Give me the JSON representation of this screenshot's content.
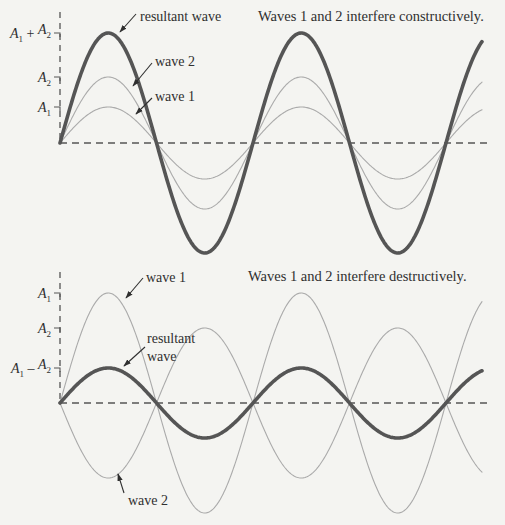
{
  "colors": {
    "background": "#f4f4f1",
    "resultant_stroke": "#555555",
    "component_stroke": "#aaaaaa",
    "axis_stroke": "#555555",
    "text": "#2f2f2f"
  },
  "chart_data": [
    {
      "type": "line",
      "title": "Waves 1 and 2 interfere constructively.",
      "origin_px": [
        60,
        143
      ],
      "x_end_px": 482,
      "axis_end_px": 487,
      "axis_top_px": 12,
      "period_px": 193,
      "series": [
        {
          "name": "wave 1",
          "amplitude_px": 36,
          "phase": 0,
          "role": "component"
        },
        {
          "name": "wave 2",
          "amplitude_px": 66,
          "phase": 0,
          "role": "component"
        },
        {
          "name": "resultant wave",
          "amplitude_px": 110,
          "phase": 0,
          "role": "resultant"
        }
      ],
      "y_ticks": [
        {
          "label_main": "A",
          "label_sub": "1",
          "label_op": "",
          "label_main2": "",
          "label_sub2": "",
          "value_px": 36
        },
        {
          "label_main": "A",
          "label_sub": "2",
          "label_op": "",
          "label_main2": "",
          "label_sub2": "",
          "value_px": 66
        },
        {
          "label_main": "A",
          "label_sub": "1",
          "label_op": "+",
          "label_main2": "A",
          "label_sub2": "2",
          "value_px": 110
        }
      ],
      "annotations": [
        {
          "text": "resultant wave",
          "text_pos": [
            140,
            21
          ],
          "arrow_from": [
            136,
            14
          ],
          "arrow_to": [
            120,
            32
          ]
        },
        {
          "text": "wave 2",
          "text_pos": [
            155,
            66
          ],
          "arrow_from": [
            152,
            63
          ],
          "arrow_to": [
            133,
            86
          ]
        },
        {
          "text": "wave 1",
          "text_pos": [
            155,
            101
          ],
          "arrow_from": [
            152,
            98
          ],
          "arrow_to": [
            136,
            114
          ]
        }
      ]
    },
    {
      "type": "line",
      "title": "Waves 1 and 2 interfere destructively.",
      "origin_px": [
        60,
        403
      ],
      "x_end_px": 482,
      "axis_end_px": 487,
      "axis_top_px": 272,
      "period_px": 193,
      "series": [
        {
          "name": "wave 1",
          "amplitude_px": 110,
          "phase": 0,
          "role": "component"
        },
        {
          "name": "wave 2",
          "amplitude_px": 75,
          "phase": 180,
          "role": "component"
        },
        {
          "name": "resultant wave",
          "amplitude_px": 35,
          "phase": 0,
          "role": "resultant"
        }
      ],
      "y_ticks": [
        {
          "label_main": "A",
          "label_sub": "1",
          "label_op": "",
          "label_main2": "",
          "label_sub2": "",
          "value_px": 110
        },
        {
          "label_main": "A",
          "label_sub": "2",
          "label_op": "",
          "label_main2": "",
          "label_sub2": "",
          "value_px": 75
        },
        {
          "label_main": "A",
          "label_sub": "1",
          "label_op": "–",
          "label_main2": "A",
          "label_sub2": "2",
          "value_px": 35
        }
      ],
      "annotations": [
        {
          "text": "wave 1",
          "text_pos": [
            146,
            282
          ],
          "arrow_from": [
            143,
            278
          ],
          "arrow_to": [
            126,
            298
          ]
        },
        {
          "text": "resultant",
          "text_pos": [
            147,
            343
          ],
          "arrow_from": [
            145,
            347
          ],
          "arrow_to": [
            124,
            366
          ]
        },
        {
          "text": "wave",
          "text_pos": [
            147,
            361
          ],
          "arrow_from": null,
          "arrow_to": null
        },
        {
          "text": "wave 2",
          "text_pos": [
            128,
            505
          ],
          "arrow_from": [
            124,
            493
          ],
          "arrow_to": [
            118,
            474
          ]
        }
      ]
    }
  ]
}
